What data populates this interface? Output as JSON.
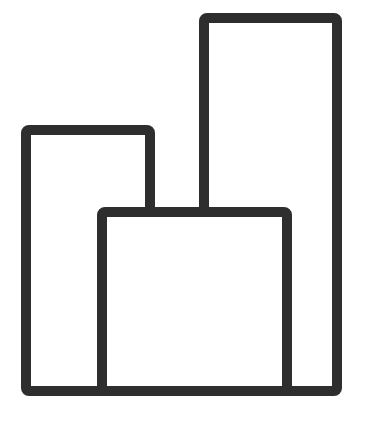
{
  "figure": {
    "background_color": "#ffffff",
    "stroke_color": "#2e2e2e",
    "fill_color": "#ffffff",
    "stroke_width": 10,
    "corner_radius": 3,
    "canvas": {
      "width": 366,
      "height": 424
    }
  },
  "chart_data": {
    "type": "bar",
    "subtitle": "",
    "xlabel": "",
    "ylabel": "",
    "categories": [
      "left",
      "right",
      "front"
    ],
    "values": [
      271,
      383,
      189
    ],
    "series": [
      {
        "name": "bars",
        "values": [
          271,
          383,
          189
        ]
      }
    ],
    "xlim": [
      0,
      366
    ],
    "ylim": [
      0,
      424
    ],
    "grid": false,
    "legend": false,
    "legend_position": "none",
    "axis_visible": false,
    "tick_labels_x": [],
    "tick_labels_y": [],
    "annotations": [],
    "baseline_y": 391,
    "bars": [
      {
        "name": "left-bar",
        "label": "left",
        "x": 21,
        "y": 125,
        "width": 134,
        "height": 271,
        "draw_order": 1
      },
      {
        "name": "tall-bar",
        "label": "right",
        "x": 199,
        "y": 13,
        "width": 143,
        "height": 383,
        "draw_order": 2
      },
      {
        "name": "front-bar",
        "label": "front",
        "x": 97,
        "y": 207,
        "width": 195,
        "height": 189,
        "draw_order": 3
      }
    ]
  }
}
